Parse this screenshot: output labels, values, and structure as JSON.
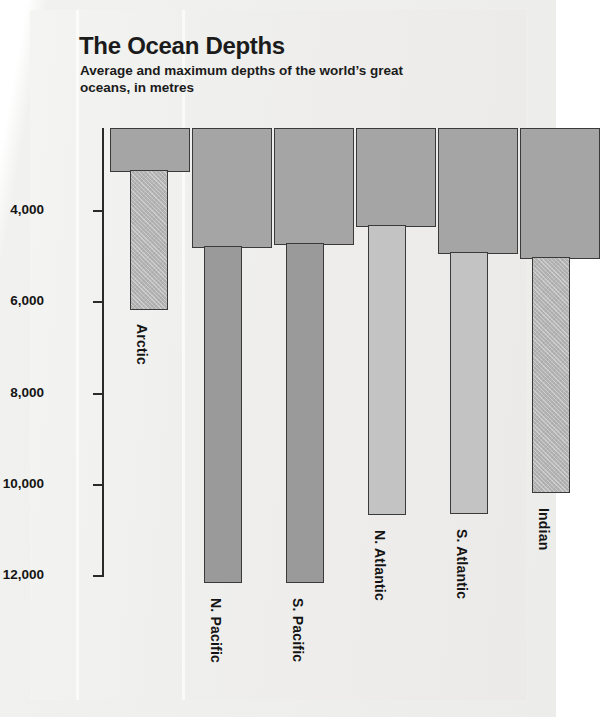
{
  "chart": {
    "title": "The Ocean Depths",
    "subtitle": "Average and maximum depths of the world’s great oceans, in metres"
  },
  "chart_data": {
    "type": "bar",
    "title": "The Ocean Depths",
    "subtitle": "Average and maximum depths of the world’s great oceans, in metres",
    "xlabel": "",
    "ylabel": "Depth (metres)",
    "ylim": [
      2180,
      12000
    ],
    "y_inverted": true,
    "grid": false,
    "legend": "none",
    "y_ticks": [
      "4,000",
      "6,000",
      "8,000",
      "10,000",
      "12,000"
    ],
    "y_tick_values": [
      4000,
      6000,
      8000,
      10000,
      12000
    ],
    "categories": [
      "Arctic",
      "N. Pacific",
      "S. Pacific",
      "N. Atlantic",
      "S. Atlantic",
      "Indian"
    ],
    "series": [
      {
        "name": "Average depth",
        "values": [
          3070,
          5000,
          4970,
          4330,
          4950,
          5030
        ]
      },
      {
        "name": "Maximum depth",
        "values": [
          6180,
          11030,
          11030,
          10540,
          10530,
          9970
        ]
      }
    ],
    "bars": [
      {
        "category": "Arctic",
        "avg": 3070,
        "max": 6180,
        "avg_left": 30,
        "avg_width": 80,
        "avg_bottom_px": 44,
        "max_left": 50,
        "max_width": 38,
        "max_bottom_px": 182,
        "max_fill": "fill-hatch",
        "label_x": 70,
        "label_y": 196
      },
      {
        "category": "N. Pacific",
        "avg": 5000,
        "max": 11030,
        "avg_left": 112,
        "avg_width": 80,
        "avg_bottom_px": 120,
        "max_left": 124,
        "max_width": 38,
        "max_bottom_px": 455,
        "max_fill": "fill-mid",
        "label_x": 144,
        "label_y": 470
      },
      {
        "category": "S. Pacific",
        "avg": 4970,
        "max": 11030,
        "avg_left": 194,
        "avg_width": 80,
        "avg_bottom_px": 117,
        "max_left": 206,
        "max_width": 38,
        "max_bottom_px": 455,
        "max_fill": "fill-mid",
        "label_x": 226,
        "label_y": 470
      },
      {
        "category": "N. Atlantic",
        "avg": 4330,
        "max": 10540,
        "avg_left": 276,
        "avg_width": 80,
        "avg_bottom_px": 99,
        "max_left": 288,
        "max_width": 38,
        "max_bottom_px": 387,
        "max_fill": "fill-light",
        "label_x": 308,
        "label_y": 402
      },
      {
        "category": "S. Atlantic",
        "avg": 4950,
        "max": 10530,
        "avg_left": 358,
        "avg_width": 80,
        "avg_bottom_px": 126,
        "max_left": 370,
        "max_width": 38,
        "max_bottom_px": 386,
        "max_fill": "fill-light",
        "label_x": 390,
        "label_y": 401
      },
      {
        "category": "Indian",
        "avg": 5030,
        "max": 9970,
        "avg_left": 440,
        "avg_width": 80,
        "avg_bottom_px": 131,
        "max_left": 452,
        "max_width": 38,
        "max_bottom_px": 365,
        "max_fill": "fill-hatch",
        "label_x": 472,
        "label_y": 380
      }
    ]
  },
  "colors": {
    "bar_average": "#a5a5a5",
    "bar_max_light": "#c3c3c3",
    "bar_max_mid": "#9a9a9a",
    "bar_outline": "#3a3a3a",
    "text": "#1b1b1b",
    "background": "#efefed"
  }
}
